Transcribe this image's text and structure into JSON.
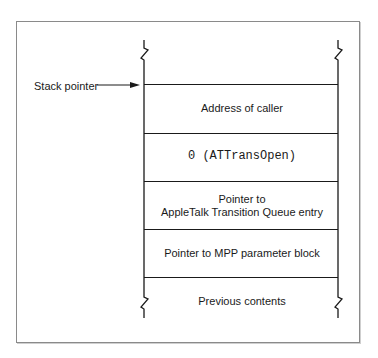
{
  "diagram": {
    "type": "stack-frame",
    "pointer_label": "Stack pointer",
    "cells": [
      {
        "lines": [
          "Address of caller"
        ],
        "mono": false
      },
      {
        "lines": [
          "0 (ATTransOpen)"
        ],
        "mono": true
      },
      {
        "lines": [
          "Pointer to",
          "AppleTalk Transition Queue entry"
        ],
        "mono": false
      },
      {
        "lines": [
          "Pointer to MPP parameter block"
        ],
        "mono": false
      },
      {
        "lines": [
          "Previous contents"
        ],
        "mono": false
      }
    ],
    "colors": {
      "line": "#1a1a1a",
      "frame": "#8a8a8a",
      "background": "#ffffff"
    }
  }
}
